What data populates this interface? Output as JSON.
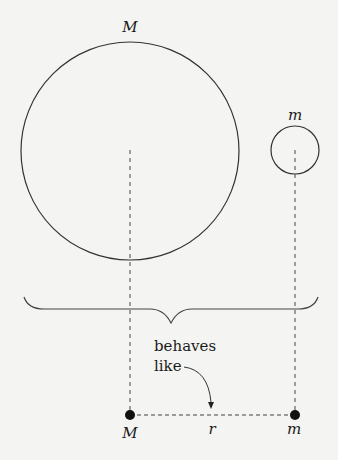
{
  "diagram": {
    "top": {
      "large_body_label": "M",
      "small_body_label": "m"
    },
    "annotation": {
      "line1": "behaves",
      "line2": "like"
    },
    "bottom": {
      "point_mass_large_label": "M",
      "point_mass_small_label": "m",
      "separation_label": "r"
    },
    "colors": {
      "background": "#f4f4f2",
      "stroke": "#333333",
      "point": "#111111"
    }
  }
}
